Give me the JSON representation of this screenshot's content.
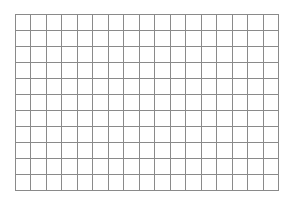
{
  "grid": {
    "columns": 17,
    "rows": 11,
    "line_color": "#8a8a8a",
    "background_color": "#ffffff"
  }
}
